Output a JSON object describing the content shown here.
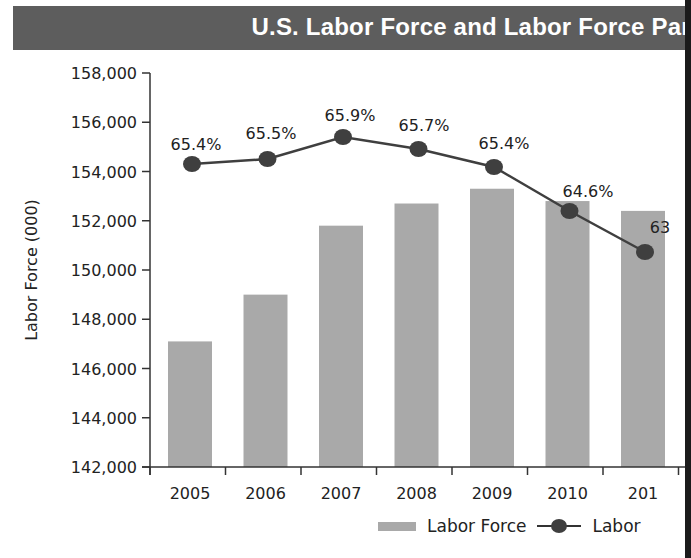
{
  "title": "U.S. Labor Force and Labor Force Part",
  "y_axis": {
    "label": "Labor Force (000)",
    "ticks": [
      "158,000",
      "156,000",
      "154,000",
      "152,000",
      "150,000",
      "148,000",
      "146,000",
      "144,000",
      "142,000"
    ]
  },
  "x_axis": {
    "ticks": [
      "2005",
      "2006",
      "2007",
      "2008",
      "2009",
      "2010",
      "201"
    ]
  },
  "line_labels": [
    "65.4%",
    "65.5%",
    "65.9%",
    "65.7%",
    "65.4%",
    "64.6%",
    "63"
  ],
  "legend": {
    "bar_label": "Labor Force",
    "line_label": "Labor"
  },
  "colors": {
    "title_bg": "#5d5d5d",
    "bar": "#a9a9a9",
    "line": "#3f3f3f",
    "text": "#222222"
  },
  "chart_data": {
    "type": "bar",
    "xlabel": "",
    "ylabel": "Labor Force (000)",
    "ylim": [
      142000,
      158000
    ],
    "categories": [
      "2005",
      "2006",
      "2007",
      "2008",
      "2009",
      "2010",
      "2011"
    ],
    "series": [
      {
        "name": "Labor Force",
        "type": "bar",
        "values": [
          147100,
          149000,
          151800,
          152700,
          153300,
          152800,
          152400
        ]
      },
      {
        "name": "Labor Force Participation Rate",
        "type": "line",
        "values": [
          65.4,
          65.5,
          65.9,
          65.7,
          65.4,
          64.6,
          63.9
        ],
        "labels": [
          "65.4%",
          "65.5%",
          "65.9%",
          "65.7%",
          "65.4%",
          "64.6%",
          "63…"
        ]
      }
    ],
    "grid": false,
    "legend_position": "bottom-right"
  }
}
